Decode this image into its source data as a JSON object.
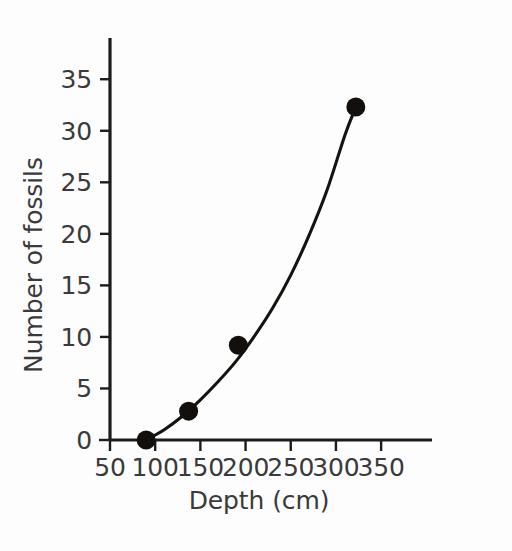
{
  "chart_data": {
    "type": "scatter",
    "title": "",
    "subtitle": "",
    "xlabel": "Depth (cm)",
    "ylabel": "Number of fossils",
    "xlim": [
      50,
      372
    ],
    "ylim": [
      0,
      39
    ],
    "xticks": [
      50,
      100,
      150,
      200,
      250,
      300,
      350
    ],
    "xticklabels": [
      "50",
      "100",
      "150",
      "200",
      "250",
      "300",
      "350"
    ],
    "yticks": [
      0,
      5,
      10,
      15,
      20,
      25,
      30,
      35
    ],
    "yticklabels": [
      "0",
      "5",
      "10",
      "15",
      "20",
      "25",
      "30",
      "35"
    ],
    "grid": false,
    "legend": false,
    "legend_position": "none",
    "series": [
      {
        "name": "Fossil counts",
        "marker": "filled-circle",
        "color": "#120f0c",
        "x": [
          90,
          137,
          192,
          322
        ],
        "y": [
          0,
          2.8,
          9.2,
          32.3
        ],
        "points": [
          {
            "x": 90,
            "y": 0
          },
          {
            "x": 137,
            "y": 2.8
          },
          {
            "x": 192,
            "y": 9.2
          },
          {
            "x": 322,
            "y": 32.3
          }
        ]
      },
      {
        "name": "Fitted curve",
        "marker": "none",
        "color": "#15130f",
        "description": "smooth increasing exponential-like trend line through the data points",
        "x": [
          90,
          110,
          130,
          150,
          170,
          190,
          210,
          230,
          250,
          270,
          290,
          310,
          322
        ],
        "y": [
          0,
          1.0,
          2.3,
          3.9,
          5.7,
          7.7,
          10.1,
          12.8,
          16.0,
          19.8,
          24.2,
          29.6,
          32.3
        ]
      }
    ],
    "annotations": []
  },
  "axes": {
    "x_axis_name": "Depth (cm)",
    "y_axis_name": "Number of fossils"
  }
}
